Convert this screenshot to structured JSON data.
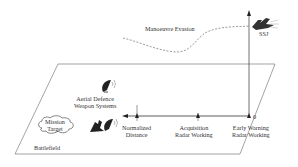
{
  "diagram": {
    "labels": {
      "manoeuvre_evasion": "Manoeuvre Evasion",
      "ssj": "SSJ",
      "aerial_defence_line1": "Aerial Defence",
      "aerial_defence_line2": "Weapon Systems",
      "mission_target_line1": "Mission",
      "mission_target_line2": "Target",
      "battlefield": "Battlefield",
      "origin": "0",
      "normalized_distance_line1": "Normalized",
      "normalized_distance_line2": "Distance",
      "acquisition_line1": "Acquisition",
      "acquisition_line2": "Radar Working",
      "early_warning_line1": "Early Warning",
      "early_warning_line2": "Radar Working"
    },
    "colors": {
      "line": "#333333",
      "plane": "#ffffff",
      "dashed": "#555555"
    }
  }
}
